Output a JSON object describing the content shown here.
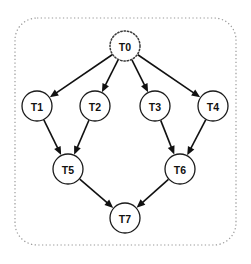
{
  "diagram": {
    "boundary": {
      "name": "workflow-boundary",
      "style": "dotted-rounded-rectangle",
      "color": "#9a9a9a",
      "x": 15,
      "y": 18,
      "width": 221,
      "height": 227,
      "radius": 22
    },
    "node_radius": 15,
    "node_border_color": "#1a1a1a",
    "node_fill_color": "#ffffff",
    "edge_color": "#111111",
    "nodes": [
      {
        "id": "T0",
        "label": "T0",
        "cx": 125,
        "cy": 46,
        "border": "dotted"
      },
      {
        "id": "T1",
        "label": "T1",
        "cx": 37,
        "cy": 106,
        "border": "solid"
      },
      {
        "id": "T2",
        "label": "T2",
        "cx": 95,
        "cy": 106,
        "border": "solid"
      },
      {
        "id": "T3",
        "label": "T3",
        "cx": 155,
        "cy": 106,
        "border": "solid"
      },
      {
        "id": "T4",
        "label": "T4",
        "cx": 213,
        "cy": 106,
        "border": "solid"
      },
      {
        "id": "T5",
        "label": "T5",
        "cx": 68,
        "cy": 169,
        "border": "solid"
      },
      {
        "id": "T6",
        "label": "T6",
        "cx": 180,
        "cy": 169,
        "border": "solid"
      },
      {
        "id": "T7",
        "label": "T7",
        "cx": 125,
        "cy": 218,
        "border": "solid"
      }
    ],
    "edges": [
      {
        "from": "T0",
        "to": "T1"
      },
      {
        "from": "T0",
        "to": "T2"
      },
      {
        "from": "T0",
        "to": "T3"
      },
      {
        "from": "T0",
        "to": "T4"
      },
      {
        "from": "T1",
        "to": "T5"
      },
      {
        "from": "T2",
        "to": "T5"
      },
      {
        "from": "T3",
        "to": "T6"
      },
      {
        "from": "T4",
        "to": "T6"
      },
      {
        "from": "T5",
        "to": "T7"
      },
      {
        "from": "T6",
        "to": "T7"
      }
    ]
  }
}
